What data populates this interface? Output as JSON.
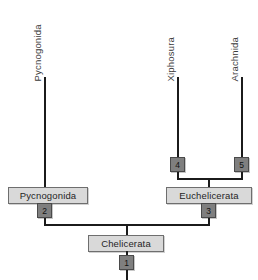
{
  "figure": {
    "kind": "cladogram",
    "background_color": "#ffffff",
    "line_color": "#1b1b1b",
    "clade_box_fill": "#d9d9d9",
    "clade_box_border": "#6e6e6e",
    "node_box_fill": "#7f7f7f",
    "node_box_border": "#4a4a4a"
  },
  "taxa": [
    {
      "label": "Pycnogonida"
    },
    {
      "label": "Xiphosura"
    },
    {
      "label": "Arachnida"
    }
  ],
  "clades": [
    {
      "label": "Pycnogonida"
    },
    {
      "label": "Euchelicerata"
    },
    {
      "label": "Chelicerata"
    }
  ],
  "nodes": [
    {
      "label": "1"
    },
    {
      "label": "2"
    },
    {
      "label": "3"
    },
    {
      "label": "4"
    },
    {
      "label": "5"
    }
  ]
}
